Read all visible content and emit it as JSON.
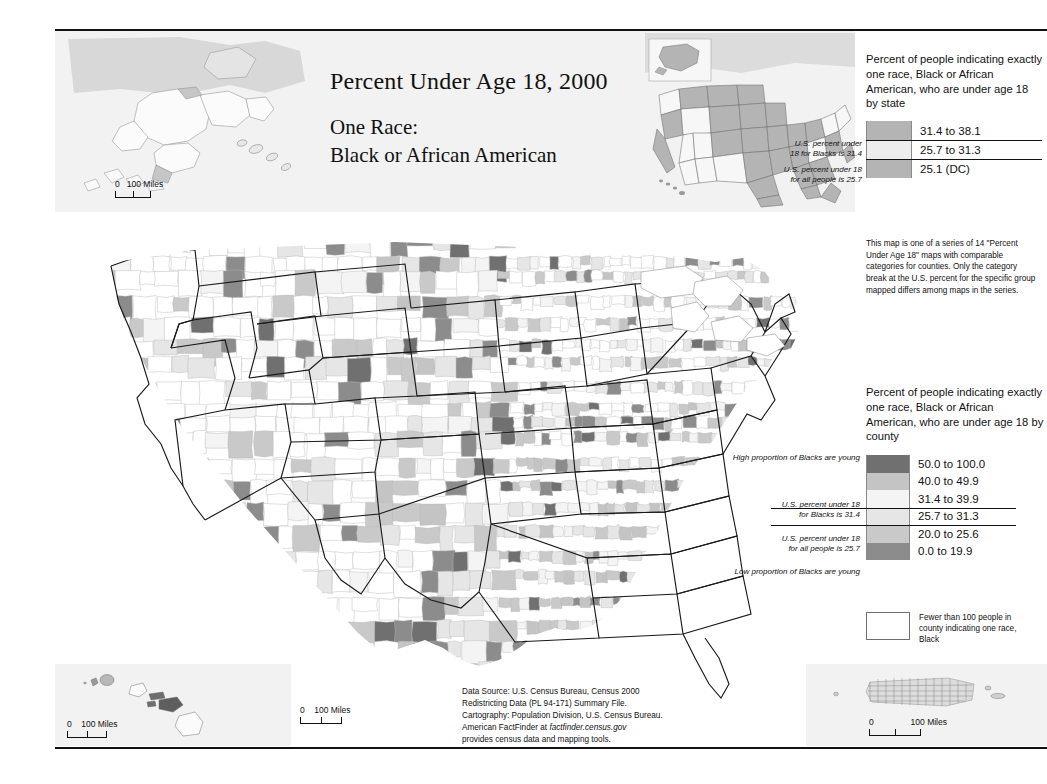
{
  "title": {
    "line1": "Percent Under Age 18, 2000",
    "line2": "One Race:",
    "line3": "Black or African American"
  },
  "state_legend": {
    "heading": "Percent of people indicating exactly one race, Black or African American, who are under age 18 by state",
    "classes": [
      {
        "label": "31.4 to 38.1",
        "color": "#b4b4b4"
      },
      {
        "label": "25.7 to 31.3",
        "color": "#ededed"
      },
      {
        "label": "25.1 (DC)",
        "color": "#b4b4b4"
      }
    ],
    "notes": [
      "U.S. percent under",
      "18 for Blacks is 31.4",
      "U.S. percent under 18",
      "for all people is 25.7"
    ]
  },
  "series_note": "This map is one of a series of 14 \"Percent Under Age 18\" maps with comparable categories for counties. Only the category break at the U.S. percent for the specific group mapped differs among maps in the series.",
  "county_legend": {
    "heading": "Percent of people indicating exactly one race, Black or African American, who are under age 18 by county",
    "classes": [
      {
        "label": "50.0 to 100.0",
        "color": "#707070"
      },
      {
        "label": "40.0 to 49.9",
        "color": "#c4c4c4"
      },
      {
        "label": "31.4 to 39.9",
        "color": "#f4f4f4"
      },
      {
        "label": "25.7 to 31.3",
        "color": "#e6e6e6"
      },
      {
        "label": "20.0 to 25.6",
        "color": "#c9c9c9"
      },
      {
        "label": "0.0 to 19.9",
        "color": "#8c8c8c"
      }
    ],
    "notes": {
      "high": "High proportion of\nBlacks are young",
      "break_black_1": "U.S. percent under 18",
      "break_black_2": "for Blacks is 31.4",
      "break_all_1": "U.S. percent under 18",
      "break_all_2": "for all people is 25.7",
      "low": "Low proportion of\nBlacks are young"
    },
    "nodata": "Fewer than 100 people in county indicating one race, Black"
  },
  "scalebars": {
    "alaska": {
      "zero": "0",
      "value": "100 Miles"
    },
    "main": {
      "zero": "0",
      "value": "100 Miles"
    },
    "hawaii": {
      "zero": "0",
      "value": "100 Miles"
    },
    "puertorico": {
      "zero": "0",
      "value": "100 Miles"
    }
  },
  "source": {
    "line1": "Data Source: U.S. Census Bureau, Census 2000",
    "line2": "Redistricting Data (PL 94-171) Summary File.",
    "line3": "Cartography: Population Division, U.S. Census Bureau.",
    "line4_pre": "American FactFinder at ",
    "line4_it": "factfinder.census.gov",
    "line5": "provides census data and mapping tools."
  },
  "colors": {
    "band": "#f2f2f2",
    "rule": "#111111",
    "county_border": "#b9b9b9",
    "state_border": "#1a1a1a"
  }
}
